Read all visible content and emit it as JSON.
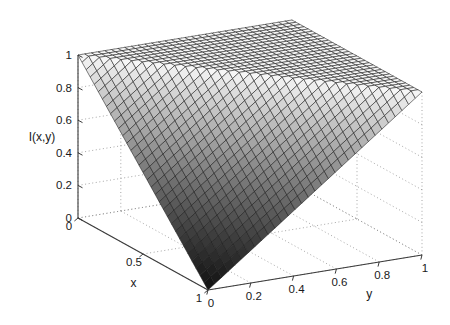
{
  "chart_data": {
    "type": "surface",
    "title": "",
    "xlabel": "x",
    "ylabel": "y",
    "zlabel": "I(x,y)",
    "xlim": [
      0,
      1
    ],
    "ylim": [
      0,
      1
    ],
    "zlim": [
      0,
      1
    ],
    "xticks": [
      0,
      0.5,
      1
    ],
    "yticks": [
      0,
      0.2,
      0.4,
      0.6,
      0.8,
      1
    ],
    "zticks": [
      0,
      0.2,
      0.4,
      0.6,
      0.8,
      1
    ],
    "xtick_labels": [
      "0",
      "0.5",
      "1"
    ],
    "ytick_labels": [
      "0",
      "0.2",
      "0.4",
      "0.6",
      "0.8",
      "1"
    ],
    "ztick_labels": [
      "0",
      "0.2",
      "0.4",
      "0.6",
      "0.8",
      "1"
    ],
    "grid": true,
    "grid_style": "dotted",
    "legend": false,
    "mesh_divisions": 32,
    "colormap": "gray",
    "mesh_line_color": "#1a1a1a",
    "surface_face_light": "#f2f2f2",
    "surface_face_dark": "#1c1c1c",
    "axis_line_color": "#3a3a3a",
    "grid_line_color": "#8a8a8a",
    "background_color": "#ffffff",
    "formula": "I(x,y) = min(1, 1 - x + y)",
    "corner_values": [
      {
        "x": 0,
        "y": 0,
        "z": 1
      },
      {
        "x": 0,
        "y": 1,
        "z": 1
      },
      {
        "x": 1,
        "y": 1,
        "z": 1
      },
      {
        "x": 1,
        "y": 0,
        "z": 0
      }
    ],
    "samples": [
      {
        "x": 0.0,
        "y": 0.0,
        "z": 1.0
      },
      {
        "x": 0.0,
        "y": 0.5,
        "z": 1.0
      },
      {
        "x": 0.0,
        "y": 1.0,
        "z": 1.0
      },
      {
        "x": 0.25,
        "y": 0.0,
        "z": 0.75
      },
      {
        "x": 0.25,
        "y": 0.25,
        "z": 1.0
      },
      {
        "x": 0.25,
        "y": 0.5,
        "z": 1.0
      },
      {
        "x": 0.25,
        "y": 1.0,
        "z": 1.0
      },
      {
        "x": 0.5,
        "y": 0.0,
        "z": 0.5
      },
      {
        "x": 0.5,
        "y": 0.25,
        "z": 0.75
      },
      {
        "x": 0.5,
        "y": 0.5,
        "z": 1.0
      },
      {
        "x": 0.5,
        "y": 1.0,
        "z": 1.0
      },
      {
        "x": 0.75,
        "y": 0.0,
        "z": 0.25
      },
      {
        "x": 0.75,
        "y": 0.25,
        "z": 0.5
      },
      {
        "x": 0.75,
        "y": 0.5,
        "z": 0.75
      },
      {
        "x": 0.75,
        "y": 1.0,
        "z": 1.0
      },
      {
        "x": 1.0,
        "y": 0.0,
        "z": 0.0
      },
      {
        "x": 1.0,
        "y": 0.25,
        "z": 0.25
      },
      {
        "x": 1.0,
        "y": 0.5,
        "z": 0.5
      },
      {
        "x": 1.0,
        "y": 0.75,
        "z": 0.75
      },
      {
        "x": 1.0,
        "y": 1.0,
        "z": 1.0
      }
    ]
  },
  "axes": {
    "z": {
      "title": "I(x,y)",
      "ticks": [
        "1",
        "0.8",
        "0.6",
        "0.4",
        "0.2",
        "0"
      ]
    },
    "x": {
      "title": "x",
      "ticks": [
        "0",
        "0.5",
        "1"
      ]
    },
    "y": {
      "title": "y",
      "ticks": [
        "0",
        "0.2",
        "0.4",
        "0.6",
        "0.8",
        "1"
      ]
    }
  }
}
